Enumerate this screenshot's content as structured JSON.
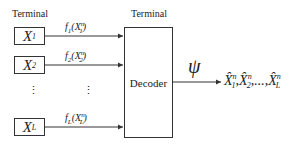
{
  "diagram": {
    "type": "block-diagram",
    "left_terminal_label": "Terminal",
    "right_terminal_label": "Terminal",
    "sources": [
      {
        "symbol": "X",
        "index": "1",
        "function_label": "f",
        "function_index": "1",
        "arg_symbol": "X",
        "arg_sup": "n",
        "arg_sub": "1"
      },
      {
        "symbol": "X",
        "index": "2",
        "function_label": "f",
        "function_index": "2",
        "arg_symbol": "X",
        "arg_sup": "n",
        "arg_sub": "2"
      },
      {
        "symbol": "X",
        "index": "L",
        "function_label": "f",
        "function_index": "L",
        "arg_symbol": "X",
        "arg_sup": "n",
        "arg_sub": "L"
      }
    ],
    "ellipsis": "⋮",
    "decoder_label": "Decoder",
    "output_function": "ψ",
    "output": {
      "hat_symbol": "X̂",
      "sup": "n",
      "subs": [
        "1",
        "2",
        "L"
      ],
      "separator": ",",
      "ellipsis": "...,"
    },
    "colors": {
      "line": "#333333",
      "text": "#222222",
      "background": "#ffffff"
    }
  }
}
